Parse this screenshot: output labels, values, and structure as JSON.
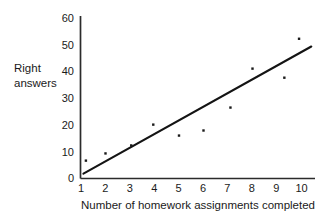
{
  "chart_data": {
    "type": "scatter",
    "title": "",
    "subtitle": "",
    "xlabel": "Number of homework assignments completed",
    "ylabel": "Right answers",
    "ylabel_line1": "Right",
    "ylabel_line2": "answers",
    "xlim": [
      1,
      10
    ],
    "ylim": [
      0,
      60
    ],
    "xticks": [
      1,
      2,
      3,
      4,
      5,
      6,
      7,
      8,
      9,
      10
    ],
    "xtick_labels": [
      "1",
      "2",
      "3",
      "4",
      "5",
      "6",
      "7",
      "8",
      "9",
      "10"
    ],
    "yticks": [
      0,
      10,
      20,
      30,
      40,
      50,
      60
    ],
    "ytick_labels": [
      "0",
      "10",
      "20",
      "30",
      "40",
      "50",
      "60"
    ],
    "grid": false,
    "legend": false,
    "legend_position": "none",
    "marker": "dot",
    "marker_color": "#1a1a1a",
    "line_color": "#141414",
    "axis_color": "#2b2b2b",
    "points": [
      {
        "x": 1.2,
        "y": 6.7
      },
      {
        "x": 2.0,
        "y": 9.4
      },
      {
        "x": 3.05,
        "y": 12.4
      },
      {
        "x": 3.95,
        "y": 20.2
      },
      {
        "x": 5.0,
        "y": 16.1
      },
      {
        "x": 6.0,
        "y": 18.0
      },
      {
        "x": 7.1,
        "y": 26.6
      },
      {
        "x": 8.0,
        "y": 41.2
      },
      {
        "x": 9.3,
        "y": 37.8
      },
      {
        "x": 9.9,
        "y": 52.4
      }
    ],
    "trend_line": {
      "x1": 1.1,
      "y1": 1.8,
      "x2": 10.4,
      "y2": 49.5
    }
  }
}
